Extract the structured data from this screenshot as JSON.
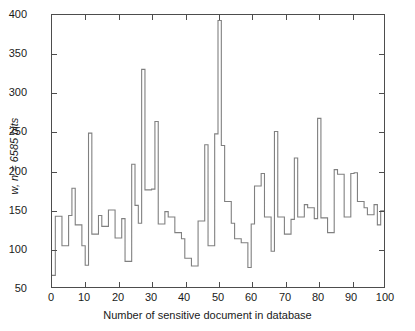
{
  "chart_data": {
    "type": "line",
    "subtype": "stairs",
    "title": "",
    "xlabel": "Number of sensitive document in database",
    "ylabel": "w, n = 6585 bits",
    "xlim": [
      0,
      100
    ],
    "ylim": [
      50,
      400
    ],
    "xticks": [
      0,
      10,
      20,
      30,
      40,
      50,
      60,
      70,
      80,
      90,
      100
    ],
    "xtick_labels": [
      "0",
      "10",
      "20",
      "30",
      "40",
      "50",
      "60",
      "70",
      "80",
      "90",
      "100"
    ],
    "yticks": [
      50,
      100,
      150,
      200,
      250,
      300,
      350,
      400
    ],
    "ytick_labels": [
      "50",
      "100",
      "150",
      "200",
      "250",
      "300",
      "350",
      "400"
    ],
    "grid": false,
    "legend": null,
    "line_color": "#808080",
    "frame_color": "#4d4d4d",
    "background": "#ffffff",
    "x": [
      1,
      2,
      3,
      4,
      5,
      6,
      7,
      8,
      9,
      10,
      11,
      12,
      13,
      14,
      15,
      16,
      17,
      18,
      19,
      20,
      21,
      22,
      23,
      24,
      25,
      26,
      27,
      28,
      29,
      30,
      31,
      32,
      33,
      34,
      35,
      36,
      37,
      38,
      39,
      40,
      41,
      42,
      43,
      44,
      45,
      46,
      47,
      48,
      49,
      50,
      51,
      52,
      53,
      54,
      55,
      56,
      57,
      58,
      59,
      60,
      61,
      62,
      63,
      64,
      65,
      66,
      67,
      68,
      69,
      70,
      71,
      72,
      73,
      74,
      75,
      76,
      77,
      78,
      79,
      80,
      81,
      82,
      83,
      84,
      85,
      86,
      87,
      88,
      89,
      90,
      91,
      92,
      93,
      94,
      95,
      96,
      97,
      98,
      99,
      100
    ],
    "values": [
      65,
      141,
      141,
      103,
      103,
      142,
      177,
      130,
      130,
      103,
      78,
      248,
      118,
      118,
      142,
      128,
      128,
      149,
      149,
      113,
      113,
      138,
      83,
      83,
      208,
      155,
      132,
      330,
      175,
      175,
      176,
      263,
      131,
      131,
      147,
      140,
      140,
      120,
      120,
      112,
      87,
      87,
      77,
      77,
      135,
      135,
      233,
      103,
      103,
      247,
      393,
      232,
      160,
      160,
      132,
      112,
      112,
      107,
      107,
      75,
      131,
      180,
      180,
      196,
      140,
      140,
      96,
      250,
      140,
      140,
      118,
      118,
      137,
      216,
      140,
      140,
      156,
      152,
      152,
      138,
      267,
      139,
      139,
      120,
      120,
      201,
      195,
      195,
      140,
      140,
      196,
      197,
      160,
      160,
      152,
      143,
      143,
      156,
      130,
      148
    ]
  }
}
